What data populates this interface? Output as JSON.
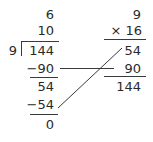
{
  "long_division": {
    "quotient_parts": [
      "6",
      "10"
    ],
    "divisor": "9",
    "dividend": "144",
    "steps": [
      {
        "subtract": "−90",
        "remainder": "54"
      },
      {
        "subtract": "−54",
        "remainder": "0"
      }
    ]
  },
  "multiplication_check": {
    "multiplicand": "9",
    "multiplier": "× 16",
    "partial_products": [
      "54",
      "90"
    ],
    "product": "144"
  },
  "colors": {
    "text": "#2a2a2a",
    "lines": "#3a3a3a",
    "background": "#ffffff"
  }
}
